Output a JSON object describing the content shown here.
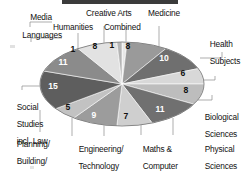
{
  "chart_data": {
    "type": "pie",
    "title": "",
    "subtitle": "",
    "xlabel": "",
    "ylabel": "",
    "legend_position": "callout-labels",
    "grid": false,
    "units": "percent",
    "total": 100,
    "categories": [
      "Creative Arts",
      "Combined",
      "Medicine",
      "Health Subjects",
      "Biological Sciences",
      "Physical Sciences",
      "Maths & Computer",
      "Engineering/ Technology",
      "Planning/ Building/ Architecture",
      "Social Studies incl. Law",
      "Languages",
      "Humanities",
      "Media"
    ],
    "values": [
      1,
      8,
      10,
      6,
      8,
      11,
      7,
      9,
      5,
      15,
      11,
      8,
      1
    ],
    "colors": [
      "#e8e8e8",
      "#9a9a9a",
      "#6f6f6f",
      "#d8d8d8",
      "#bdbdbd",
      "#707070",
      "#cfcfcf",
      "#9c9c9c",
      "#c2c2c2",
      "#5e5e5e",
      "#8b8b8b",
      "#e2e2e2",
      "#b4b4b4"
    ]
  },
  "labels": {
    "media": "Media",
    "humanities": "Humanities",
    "creative_arts": "Creative Arts",
    "combined": "Combined",
    "medicine": "Medicine",
    "health_subjects_l1": "Health",
    "health_subjects_l2": "Subjects",
    "biological_l1": "Biological",
    "biological_l2": "Sciences",
    "physical_l1": "Physical",
    "physical_l2": "Sciences",
    "maths_l1": "Maths &",
    "maths_l2": "Computer",
    "engineering_l1": "Engineering/",
    "engineering_l2": "Technology",
    "planning_l1": "Planning/",
    "planning_l2": "Building/",
    "planning_l3": "Architecture",
    "social_l1": "Social",
    "social_l2": "Studies",
    "social_l3": "incl. Law",
    "languages": "Languages"
  },
  "values": {
    "humanities": "8",
    "media": "1",
    "creative_arts": "1",
    "combined": "8",
    "medicine": "10",
    "health_subjects": "6",
    "biological": "8",
    "physical": "11",
    "maths": "7",
    "engineering": "9",
    "planning": "5",
    "social": "15",
    "languages": "11"
  }
}
